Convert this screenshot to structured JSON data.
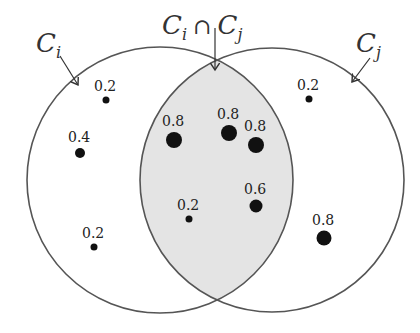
{
  "colors": {
    "intersection_fill": "#e4e4e4",
    "stroke": "#555555",
    "dot": "#111111"
  },
  "circles": [
    {
      "name": "C_i",
      "label": "C",
      "subscript": "i",
      "cx": 160,
      "cy": 180,
      "r": 133
    },
    {
      "name": "C_j",
      "label": "C",
      "subscript": "j",
      "cx": 272,
      "cy": 180,
      "r": 132
    }
  ],
  "labels": {
    "ci": {
      "main": "C",
      "sub": "i"
    },
    "cj": {
      "main": "C",
      "sub": "j"
    },
    "intersection": {
      "left_main": "C",
      "left_sub": "i",
      "op": "∩",
      "right_main": "C",
      "right_sub": "j"
    }
  },
  "points": [
    {
      "region": "Ci only",
      "value": "0.2",
      "x": 106,
      "y": 100,
      "r": 3.5
    },
    {
      "region": "Ci only",
      "value": "0.4",
      "x": 80,
      "y": 153,
      "r": 5
    },
    {
      "region": "Ci only",
      "value": "0.2",
      "x": 94,
      "y": 247,
      "r": 3.5
    },
    {
      "region": "intersection",
      "value": "0.8",
      "x": 174,
      "y": 140,
      "r": 8
    },
    {
      "region": "intersection",
      "value": "0.8",
      "x": 229,
      "y": 133,
      "r": 8
    },
    {
      "region": "intersection",
      "value": "0.8",
      "x": 256,
      "y": 145,
      "r": 8
    },
    {
      "region": "intersection",
      "value": "0.2",
      "x": 189,
      "y": 219,
      "r": 3.5
    },
    {
      "region": "intersection",
      "value": "0.6",
      "x": 256,
      "y": 206,
      "r": 6.5
    },
    {
      "region": "Cj only",
      "value": "0.2",
      "x": 309,
      "y": 99,
      "r": 3.5
    },
    {
      "region": "Cj only",
      "value": "0.8",
      "x": 324,
      "y": 238,
      "r": 7.5
    }
  ]
}
